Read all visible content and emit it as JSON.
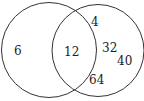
{
  "diagram": {
    "type": "venn",
    "sets": [
      {
        "name": "left-set",
        "only": [
          "6"
        ]
      },
      {
        "name": "right-set",
        "only": [
          "4",
          "32",
          "40",
          "64"
        ]
      }
    ],
    "intersection": [
      "12"
    ],
    "labels": {
      "left_only_0": "6",
      "intersection_0": "12",
      "right_only_0": "4",
      "right_only_1": "32",
      "right_only_2": "40",
      "right_only_3": "64"
    },
    "colors": {
      "stroke": "#333333",
      "text": "#222222",
      "background": "#ffffff"
    }
  }
}
